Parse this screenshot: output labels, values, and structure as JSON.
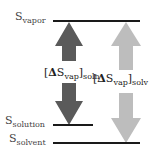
{
  "levels": {
    "vapor": {
      "symbol": "S",
      "subscript": "vapor"
    },
    "solution": {
      "symbol": "S",
      "subscript": "solution"
    },
    "solvent": {
      "symbol": "S",
      "subscript": "solvent"
    }
  },
  "arrows": {
    "solution_delta": {
      "open": "[",
      "delta": "Δ",
      "symbol": "S",
      "subscript": "vap",
      "close": "]",
      "outer_subscript": "soln",
      "color": "#5a5a5a"
    },
    "solvent_delta": {
      "open": "[",
      "delta": "Δ",
      "symbol": "S",
      "subscript": "vap",
      "close": "]",
      "outer_subscript": "solv",
      "color": "#bdbdbd"
    }
  },
  "colors": {
    "level_line": "#1a1a1a",
    "dark_arrow": "#5a5a5a",
    "light_arrow": "#bdbdbd"
  }
}
